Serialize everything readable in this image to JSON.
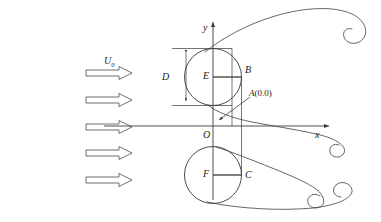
{
  "figure": {
    "background_color": "#ffffff",
    "line_color": "#3a3a3a",
    "label_color": "#1a1a1a",
    "width": 381,
    "height": 222
  },
  "axes": {
    "y_label": "y",
    "x_label": "x",
    "origin_label": "O"
  },
  "inflow": {
    "velocity_label": "U",
    "velocity_subscript": "0",
    "arrow_count": 5
  },
  "dimension": {
    "diameter_label": "D"
  },
  "points": {
    "upper_center": "E",
    "upper_right": "B",
    "lower_center": "F",
    "lower_right": "C",
    "origin_point_label": "A",
    "origin_point_coords": "(0.0)"
  }
}
